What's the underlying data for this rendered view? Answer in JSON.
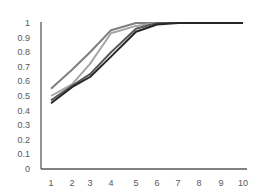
{
  "chart_data": {
    "type": "line",
    "title": "",
    "xlabel": "",
    "ylabel": "",
    "x": [
      1,
      2,
      3,
      4,
      5,
      6,
      7,
      8,
      9,
      10
    ],
    "x_tick_labels": [
      "1",
      "2",
      "3",
      "4",
      "5",
      "6",
      "7",
      "8",
      "9",
      "10"
    ],
    "y_tick_labels": [
      "0",
      "0.1",
      "0.2",
      "0.3",
      "0.4",
      "0.5",
      "0.6",
      "0.7",
      "0.8",
      "0.9",
      "1"
    ],
    "ylim": [
      0,
      1
    ],
    "grid": false,
    "legend": null,
    "series": [
      {
        "name": "Series 1",
        "color": "#7f7f7f",
        "values": [
          0.55,
          0.68,
          0.8,
          0.95,
          1.0,
          1.0,
          1.0,
          1.0,
          1.0,
          1.0
        ]
      },
      {
        "name": "Series 2",
        "color": "#a6a6a6",
        "values": [
          0.5,
          0.58,
          0.72,
          0.93,
          0.98,
          1.0,
          1.0,
          1.0,
          1.0,
          1.0
        ]
      },
      {
        "name": "Series 3",
        "color": "#595959",
        "values": [
          0.47,
          0.57,
          0.65,
          0.8,
          0.96,
          1.0,
          1.0,
          1.0,
          1.0,
          1.0
        ]
      },
      {
        "name": "Series 4",
        "color": "#262626",
        "values": [
          0.45,
          0.56,
          0.63,
          0.77,
          0.94,
          0.99,
          1.0,
          1.0,
          1.0,
          1.0
        ]
      }
    ]
  }
}
